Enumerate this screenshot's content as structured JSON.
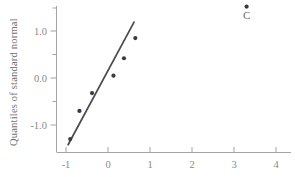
{
  "chart_data": {
    "type": "scatter",
    "title": "",
    "xlabel": "",
    "ylabel": "Quantiles of standard normal",
    "xlim": [
      -1.35,
      4.25
    ],
    "ylim": [
      -1.62,
      1.72
    ],
    "grid": false,
    "legend": null,
    "xticks": [
      -1,
      0,
      1,
      2,
      3,
      4
    ],
    "xtick_labels": [
      "-1",
      "0",
      "1",
      "2",
      "3",
      "4"
    ],
    "yticks": [
      -1.0,
      0.0,
      1.0
    ],
    "ytick_labels": [
      "-1.0",
      "0.0",
      "1.0"
    ],
    "yminor_ticks": [
      -0.5,
      0.5,
      1.5
    ],
    "series": [
      {
        "name": "sample quantiles",
        "marker": "filled-circle",
        "color": "#3a3a42",
        "points": [
          {
            "x": -0.9,
            "y": -1.3,
            "label": ""
          },
          {
            "x": -0.68,
            "y": -0.7,
            "label": ""
          },
          {
            "x": -0.38,
            "y": -0.32,
            "label": ""
          },
          {
            "x": 0.13,
            "y": 0.05,
            "label": ""
          },
          {
            "x": 0.38,
            "y": 0.42,
            "label": ""
          },
          {
            "x": 0.65,
            "y": 0.85,
            "label": ""
          },
          {
            "x": 3.3,
            "y": 1.52,
            "label": "C"
          }
        ]
      }
    ],
    "reference_line": {
      "name": "fitted line",
      "color": "#4a4a52",
      "x_start": -0.95,
      "y_start": -1.42,
      "x_end": 0.62,
      "y_end": 1.19
    },
    "annotations": [
      {
        "text": "C",
        "x": 3.3,
        "y": 1.25
      }
    ]
  },
  "colors": {
    "point": "#3a3a42",
    "line": "#4a4a52",
    "axis": "#9a9a9a",
    "text": "#8a8a8a",
    "background": "#ffffff"
  }
}
